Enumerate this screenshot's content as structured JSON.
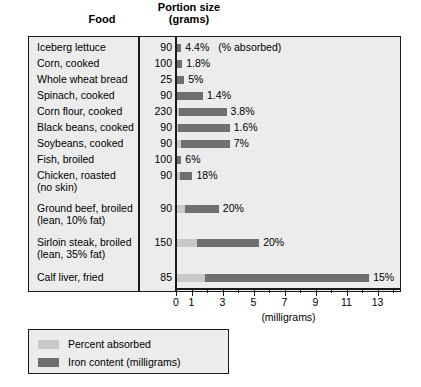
{
  "header": {
    "food_label": "Food",
    "portion_label": "Portion size\n(grams)",
    "portion_line1": "Portion size",
    "portion_line2": "(grams)"
  },
  "axis": {
    "title": "(milligrams)",
    "tick_labels": [
      "0",
      "1",
      "3",
      "5",
      "7",
      "9",
      "11",
      "13"
    ],
    "tick_values": [
      0,
      1,
      3,
      5,
      7,
      9,
      11,
      13
    ],
    "min": 0,
    "max": 14.5
  },
  "legend": {
    "position": "bottom-left",
    "items": [
      {
        "label": "Percent absorbed",
        "color": "#c9c9c9"
      },
      {
        "label": "Iron content (milligrams)",
        "color": "#6f6f6f"
      }
    ]
  },
  "colors": {
    "percent_absorbed": "#c9c9c9",
    "iron_content": "#6f6f6f",
    "panel_background": "#ececec",
    "border": "#1a1a1a",
    "page_background": "#ffffff"
  },
  "first_row_annotation": "(% absorbed)",
  "chart_data": {
    "type": "bar",
    "orientation": "horizontal",
    "title": "",
    "xlabel": "(milligrams)",
    "ylabel": "Food",
    "xlim": [
      0,
      14.5
    ],
    "grid": false,
    "legend_position": "bottom-left",
    "columns": [
      "Food",
      "Portion size (grams)",
      "Percent absorbed",
      "Iron content (milligrams)"
    ],
    "rows": [
      {
        "food": "Iceberg lettuce",
        "food_line2": "",
        "portion": "90",
        "percent_label": "4.4%",
        "percent_absorbed": 4.4,
        "absorbed_mg": 0.02,
        "iron_mg": 0.3
      },
      {
        "food": "Corn, cooked",
        "food_line2": "",
        "portion": "100",
        "percent_label": "1.8%",
        "percent_absorbed": 1.8,
        "absorbed_mg": 0.01,
        "iron_mg": 0.35
      },
      {
        "food": "Whole wheat bread",
        "food_line2": "",
        "portion": "25",
        "percent_label": "5%",
        "percent_absorbed": 5.0,
        "absorbed_mg": 0.03,
        "iron_mg": 0.5
      },
      {
        "food": "Spinach, cooked",
        "food_line2": "",
        "portion": "90",
        "percent_label": "1.4%",
        "percent_absorbed": 1.4,
        "absorbed_mg": 0.02,
        "iron_mg": 1.7
      },
      {
        "food": "Corn flour, cooked",
        "food_line2": "",
        "portion": "230",
        "percent_label": "3.8%",
        "percent_absorbed": 3.8,
        "absorbed_mg": 0.12,
        "iron_mg": 3.2
      },
      {
        "food": "Black beans, cooked",
        "food_line2": "",
        "portion": "90",
        "percent_label": "1.6%",
        "percent_absorbed": 1.6,
        "absorbed_mg": 0.05,
        "iron_mg": 3.4
      },
      {
        "food": "Soybeans, cooked",
        "food_line2": "",
        "portion": "90",
        "percent_label": "7%",
        "percent_absorbed": 7.0,
        "absorbed_mg": 0.24,
        "iron_mg": 3.4
      },
      {
        "food": "Fish, broiled",
        "food_line2": "",
        "portion": "100",
        "percent_label": "6%",
        "percent_absorbed": 6.0,
        "absorbed_mg": 0.02,
        "iron_mg": 0.3
      },
      {
        "food": "Chicken, roasted",
        "food_line2": "(no skin)",
        "portion": "90",
        "percent_label": "18%",
        "percent_absorbed": 18.0,
        "absorbed_mg": 0.18,
        "iron_mg": 1.0
      },
      {
        "food": "Ground beef, broiled",
        "food_line2": "(lean, 10% fat)",
        "portion": "90",
        "percent_label": "20%",
        "percent_absorbed": 20.0,
        "absorbed_mg": 0.5,
        "iron_mg": 2.7
      },
      {
        "food": "Sirloin steak, broiled",
        "food_line2": "(lean, 35% fat)",
        "portion": "150",
        "percent_label": "20%",
        "percent_absorbed": 20.0,
        "absorbed_mg": 1.3,
        "iron_mg": 5.3
      },
      {
        "food": "Calf liver, fried",
        "food_line2": "",
        "portion": "85",
        "percent_label": "15%",
        "percent_absorbed": 15.0,
        "absorbed_mg": 1.8,
        "iron_mg": 12.4
      }
    ]
  }
}
